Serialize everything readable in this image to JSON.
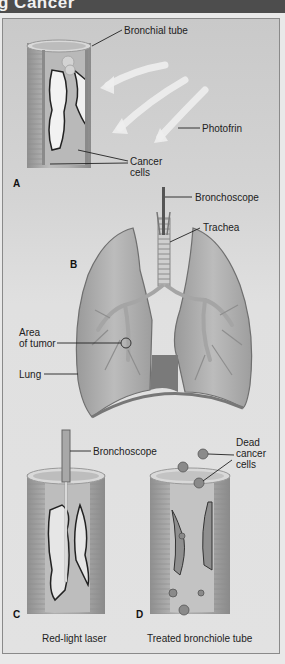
{
  "header": {
    "title_fragment": "g Cancer"
  },
  "figure": {
    "panel_a": {
      "letter": "A",
      "labels": {
        "bronchial_tube": "Bronchial tube",
        "photofrin": "Photofrin",
        "cancer_cells": [
          "Cancer",
          "cells"
        ]
      }
    },
    "panel_b": {
      "letter": "B",
      "labels": {
        "bronchoscope": "Bronchoscope",
        "trachea": "Trachea",
        "area_of_tumor": [
          "Area",
          "of tumor"
        ],
        "lung": "Lung"
      }
    },
    "panel_c": {
      "letter": "C",
      "labels": {
        "bronchoscope": "Bronchoscope"
      },
      "caption": "Red-light laser"
    },
    "panel_d": {
      "letter": "D",
      "labels": {
        "dead_cancer_cells": [
          "Dead",
          "cancer",
          "cells"
        ]
      },
      "caption": "Treated bronchiole tube"
    }
  },
  "colors": {
    "header_bg": "#4d4d4d",
    "panel_border": "#8a8a8a",
    "tissue": "#a9a9a9",
    "tumor": "#f2f2f2",
    "outline": "#222222"
  }
}
